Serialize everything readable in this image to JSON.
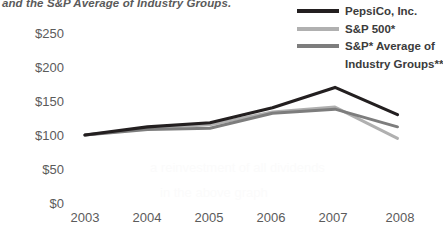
{
  "caption": {
    "clipped_line": "and the S&P Average of Industry Groups."
  },
  "legend": {
    "position": "top-right",
    "items": [
      {
        "label": "PepsiCo, Inc.",
        "color": "#231f20",
        "continuation": ""
      },
      {
        "label": "S&P 500*",
        "color": "#b0b0b0",
        "continuation": ""
      },
      {
        "label": "S&P* Average of",
        "color": "#7d7d7d",
        "continuation": "Industry Groups***"
      }
    ]
  },
  "axes": {
    "y_ticks": [
      "$250",
      "$200",
      "$150",
      "$100",
      "$50",
      "$0"
    ],
    "x_ticks": [
      "2003",
      "2004",
      "2005",
      "2006",
      "2007",
      "2008"
    ]
  },
  "chart_data": {
    "type": "line",
    "title": "",
    "subtitle": "",
    "xlabel": "",
    "ylabel": "",
    "categories": [
      "2003",
      "2004",
      "2005",
      "2006",
      "2007",
      "2008"
    ],
    "ylim": [
      0,
      250
    ],
    "ytick_values": [
      250,
      200,
      150,
      100,
      50,
      0
    ],
    "grid": false,
    "legend_position": "top-right",
    "value_prefix": "$",
    "series": [
      {
        "name": "PepsiCo, Inc.",
        "color": "#231f20",
        "values": [
          100,
          112,
          118,
          140,
          170,
          130
        ]
      },
      {
        "name": "S&P 500*",
        "color": "#b0b0b0",
        "values": [
          100,
          110,
          115,
          134,
          141,
          95
        ]
      },
      {
        "name": "S&P* Average of Industry Groups***",
        "color": "#7d7d7d",
        "values": [
          100,
          108,
          110,
          132,
          138,
          112
        ]
      }
    ]
  },
  "ghost_text": [
    {
      "text": "a reinvestment of all dividends",
      "x": 150,
      "y": 160
    },
    {
      "text": "in the above graph",
      "x": 160,
      "y": 185
    }
  ]
}
